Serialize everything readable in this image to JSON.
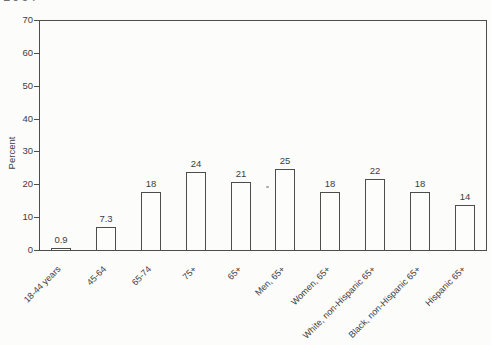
{
  "page": {
    "clipped_top_text": "1997"
  },
  "chart_data": {
    "type": "bar",
    "title": "",
    "xlabel": "",
    "ylabel": "Percent",
    "categories": [
      "18-44 years",
      "45-64",
      "65-74",
      "75+",
      "65+",
      "Men, 65+",
      "Women, 65+",
      "White, non-Hispanic 65+",
      "Black, non-Hispanic 65+",
      "Hispanic 65+"
    ],
    "values": [
      0.9,
      7.3,
      18,
      24,
      21,
      25,
      18,
      22,
      18,
      14
    ],
    "value_labels": [
      "0.9",
      "7.3",
      "18",
      "24",
      "21",
      "25",
      "18",
      "22",
      "18",
      "14"
    ],
    "y_ticks": [
      0,
      10,
      20,
      30,
      40,
      50,
      60,
      70
    ],
    "ylim": [
      0,
      70
    ],
    "grid": false,
    "legend": false,
    "colors": {
      "bar_fill": "#fdfdfc",
      "bar_border": "#4d4d4d",
      "axis_line": "#4d4d4d",
      "text": "#3c3c3c"
    }
  }
}
